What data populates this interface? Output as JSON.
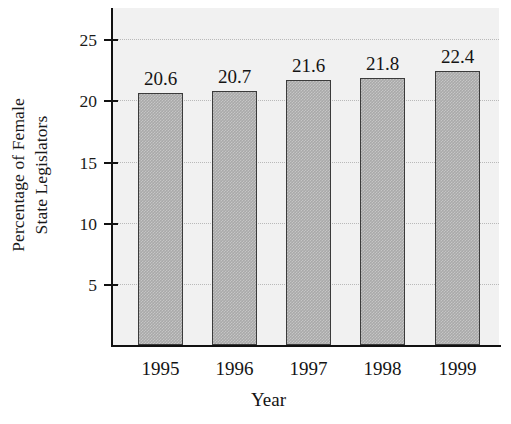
{
  "chart_data": {
    "type": "bar",
    "title": "",
    "subtitle": "",
    "xlabel": "Year",
    "ylabel": "Percentage of Female State Legislators",
    "ylabel_lines": [
      "Percentage of Female",
      "State Legislators"
    ],
    "categories": [
      "1995",
      "1996",
      "1997",
      "1998",
      "1999"
    ],
    "values": [
      20.6,
      20.7,
      21.6,
      21.8,
      22.4
    ],
    "value_labels": [
      "20.6",
      "20.7",
      "21.6",
      "21.8",
      "22.4"
    ],
    "ylim": [
      0,
      27.5
    ],
    "yticks": [
      5,
      10,
      15,
      20,
      25
    ],
    "ytick_labels": [
      "5",
      "10",
      "15",
      "20",
      "25"
    ],
    "grid": true,
    "grid_style": "dotted-horizontal",
    "legend": null,
    "legend_position": "none",
    "series": [
      {
        "name": "Percentage of Female State Legislators",
        "values": [
          20.6,
          20.7,
          21.6,
          21.8,
          22.4
        ]
      }
    ],
    "colors": {
      "bar_fill": "#a9a9a9",
      "bar_border": "#3b3b3b",
      "plot_background": "#f1f1f1",
      "page_background": "#ffffff",
      "axis": "#111111",
      "gridline": "#b9b9b9",
      "text": "#141414"
    }
  }
}
